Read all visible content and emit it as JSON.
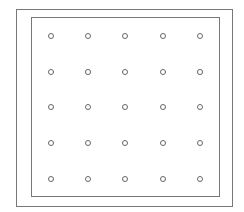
{
  "diagram": {
    "type": "dot-grid",
    "rows": 5,
    "columns": 5,
    "colors": {
      "frame": "#777777",
      "dot": "#666666",
      "background": "#ffffff"
    },
    "outer_frame": {
      "x": 16,
      "y": 9,
      "width": 217,
      "height": 198
    },
    "inner_frame": {
      "x": 31,
      "y": 17,
      "width": 189,
      "height": 180
    },
    "column_x": [
      50,
      87,
      124,
      162,
      199
    ],
    "row_y": [
      35,
      71,
      106,
      142,
      178
    ]
  }
}
